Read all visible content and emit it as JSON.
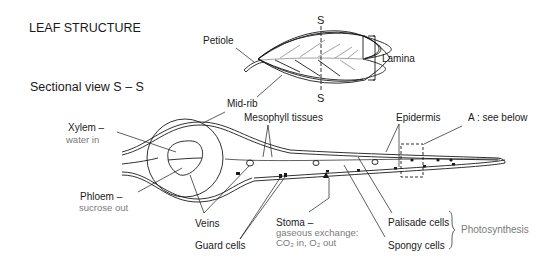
{
  "title": "LEAF STRUCTURE",
  "section_title": "Sectional view  S – S",
  "leaf_view": {
    "petiole": "Petiole",
    "lamina": "Lamina",
    "section_mark_top": "S",
    "section_mark_bottom": "S",
    "midrib": "Mid-rib"
  },
  "cross_section": {
    "xylem": "Xylem –",
    "xylem_note": "water in",
    "phloem": "Phloem –",
    "phloem_note": "sucrose out",
    "veins": "Veins",
    "guard_cells": "Guard cells",
    "mesophyll": "Mesophyll tissues",
    "epidermis": "Epidermis",
    "detail_ref": "A : see below",
    "stoma": "Stoma –",
    "stoma_note_1": "gaseous exchange:",
    "stoma_note_2": "CO₂ in, O₂ out",
    "palisade": "Palisade cells",
    "spongy": "Spongy cells",
    "photosynthesis": "Photosynthesis"
  },
  "colors": {
    "ink": "#1a1a1a",
    "note": "#7a7a7a",
    "background": "#ffffff"
  }
}
